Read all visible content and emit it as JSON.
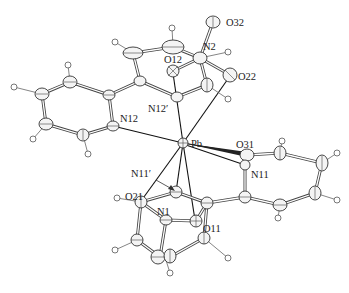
{
  "figure": {
    "type": "ORTEP crystal structure",
    "central_atom": "Pb",
    "labels": [
      {
        "id": "Pb",
        "text": "Pb",
        "x": 191,
        "y": 144
      },
      {
        "id": "N12",
        "text": "N12",
        "x": 123,
        "y": 129
      },
      {
        "id": "N12p",
        "text": "N12′",
        "x": 150,
        "y": 109
      },
      {
        "id": "O12",
        "text": "O12",
        "x": 165,
        "y": 63
      },
      {
        "id": "N2",
        "text": "N2",
        "x": 204,
        "y": 49
      },
      {
        "id": "O32",
        "text": "O32",
        "x": 228,
        "y": 27
      },
      {
        "id": "O22",
        "text": "O22",
        "x": 237,
        "y": 79
      },
      {
        "id": "O31",
        "text": "O31",
        "x": 236,
        "y": 147
      },
      {
        "id": "N11",
        "text": "N11",
        "x": 250,
        "y": 178
      },
      {
        "id": "N11p",
        "text": "N11′",
        "x": 132,
        "y": 177
      },
      {
        "id": "O21",
        "text": "O21",
        "x": 124,
        "y": 202
      },
      {
        "id": "N1",
        "text": "N1",
        "x": 157,
        "y": 220
      },
      {
        "id": "O11",
        "text": "O11",
        "x": 207,
        "y": 231
      }
    ]
  }
}
